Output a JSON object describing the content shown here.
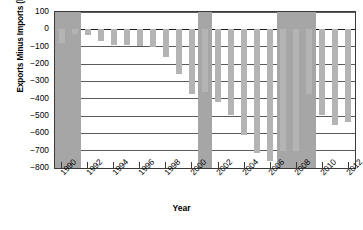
{
  "chart_data": {
    "type": "bar",
    "title": "",
    "xlabel": "Year",
    "ylabel": "Exports Minus Imports (billions of dollars)",
    "ylim": [
      -800,
      100
    ],
    "yticks": [
      100,
      0,
      -100,
      -200,
      -300,
      -400,
      -500,
      -600,
      -700,
      -800
    ],
    "ytick_labels": [
      "100",
      "0",
      "−100",
      "−200",
      "−300",
      "−400",
      "−500",
      "−600",
      "−700",
      "−800"
    ],
    "xticks": [
      1990,
      1992,
      1994,
      1996,
      1998,
      2000,
      2002,
      2004,
      2006,
      2008,
      2010,
      2012
    ],
    "xtick_labels": [
      "1990",
      "1992",
      "1994",
      "1996",
      "1998",
      "2000",
      "2002",
      "2004",
      "2006",
      "2008",
      "2010",
      "2012"
    ],
    "grid": true,
    "legend": "none",
    "bar_color": "#b4b4b4",
    "band_color": "#a6a6a6",
    "categories": [
      1990,
      1991,
      1992,
      1993,
      1994,
      1995,
      1996,
      1997,
      1998,
      1999,
      2000,
      2001,
      2002,
      2003,
      2004,
      2005,
      2006,
      2007,
      2008,
      2009,
      2010,
      2011,
      2012
    ],
    "values": [
      -77,
      -27,
      -35,
      -65,
      -93,
      -91,
      -96,
      -101,
      -160,
      -255,
      -375,
      -362,
      -421,
      -495,
      -610,
      -715,
      -760,
      -700,
      -700,
      -375,
      -495,
      -550,
      -535
    ],
    "annotations": [
      {
        "label": "recession-band",
        "start": 1990,
        "end": 1991
      },
      {
        "label": "recession-band",
        "start": 2001,
        "end": 2001
      },
      {
        "label": "recession-band",
        "start": 2007,
        "end": 2009
      }
    ]
  }
}
